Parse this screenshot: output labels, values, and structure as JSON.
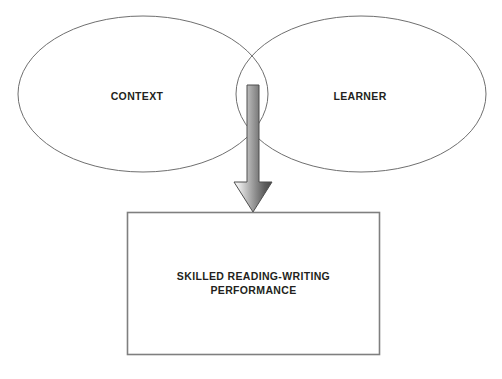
{
  "diagram": {
    "background_color": "#ffffff",
    "ellipse_stroke_color": "#6f6f6f",
    "box_stroke_color": "#7f7f7f",
    "arrow_gradient_light": "#f2f2f2",
    "arrow_gradient_dark": "#4a4a4a",
    "text_color": "#231f20",
    "nodes": {
      "left_ellipse": {
        "label": "CONTEXT",
        "shape": "ellipse",
        "icon": "ellipse-outline-icon"
      },
      "right_ellipse": {
        "label": "LEARNER",
        "shape": "ellipse",
        "icon": "ellipse-outline-icon"
      },
      "outcome_box": {
        "shape": "rectangle",
        "icon": "rectangle-outline-icon",
        "label_line_1": "SKILLED READING-WRITING",
        "label_line_2": "PERFORMANCE"
      }
    },
    "connector": {
      "icon": "down-arrow-icon",
      "direction": "down",
      "from": "overlap of CONTEXT and LEARNER",
      "to": "SKILLED READING-WRITING PERFORMANCE"
    }
  }
}
